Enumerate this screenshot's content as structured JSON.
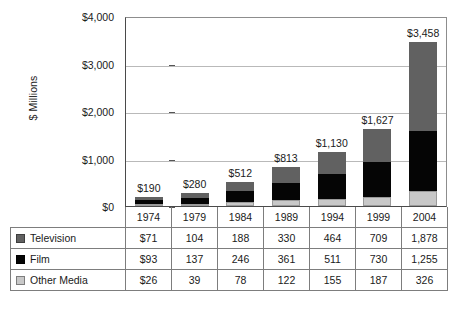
{
  "chart_data": {
    "type": "bar",
    "subtype": "stacked-bar-with-data-table",
    "title": "",
    "xlabel": "",
    "ylabel": "$ Millions",
    "ylim": [
      0,
      4000
    ],
    "yticks": [
      0,
      1000,
      2000,
      3000,
      4000
    ],
    "ytick_labels": [
      "$0",
      "$1,000",
      "$2,000",
      "$3,000",
      "$4,000"
    ],
    "grid": true,
    "legend_position": "data-table-left-column",
    "categories": [
      "1974",
      "1979",
      "1984",
      "1989",
      "1994",
      "1999",
      "2004"
    ],
    "stack_order_bottom_to_top": [
      "Other Media",
      "Film",
      "Television"
    ],
    "series": [
      {
        "name": "Television",
        "color": "#616161",
        "values": [
          71,
          104,
          188,
          330,
          464,
          709,
          1878
        ],
        "display_values": [
          "$71",
          "104",
          "188",
          "330",
          "464",
          "709",
          "1,878"
        ]
      },
      {
        "name": "Film",
        "color": "#050505",
        "values": [
          93,
          137,
          246,
          361,
          511,
          730,
          1255
        ],
        "display_values": [
          "$93",
          "137",
          "246",
          "361",
          "511",
          "730",
          "1,255"
        ]
      },
      {
        "name": "Other Media",
        "color": "#c8c8c8",
        "values": [
          26,
          39,
          78,
          122,
          155,
          187,
          326
        ],
        "display_values": [
          "$26",
          "39",
          "78",
          "122",
          "155",
          "187",
          "326"
        ]
      }
    ],
    "totals": [
      190,
      280,
      512,
      813,
      1130,
      1627,
      3458
    ],
    "total_labels": [
      "$190",
      "$280",
      "$512",
      "$813",
      "$1,130",
      "$1,627",
      "$3,458"
    ]
  },
  "table": {
    "year_row": [
      "1974",
      "1979",
      "1984",
      "1989",
      "1994",
      "1999",
      "2004"
    ],
    "rows": [
      {
        "label": "Television",
        "swatch": "swatch-tv",
        "cells": [
          "$71",
          "104",
          "188",
          "330",
          "464",
          "709",
          "1,878"
        ]
      },
      {
        "label": "Film",
        "swatch": "swatch-film",
        "cells": [
          "$93",
          "137",
          "246",
          "361",
          "511",
          "730",
          "1,255"
        ]
      },
      {
        "label": "Other Media",
        "swatch": "swatch-other",
        "cells": [
          "$26",
          "39",
          "78",
          "122",
          "155",
          "187",
          "326"
        ]
      }
    ]
  }
}
